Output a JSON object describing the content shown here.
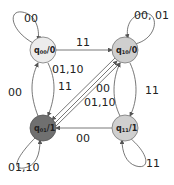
{
  "diagram": {
    "type": "state-machine",
    "states": [
      {
        "id": "q00",
        "name": "q",
        "sub": "00",
        "output": "/0",
        "fill": "#ececec",
        "cx": 43,
        "cy": 50
      },
      {
        "id": "q10",
        "name": "q",
        "sub": "10",
        "output": "/0",
        "fill": "#cfcfcf",
        "cx": 125,
        "cy": 50
      },
      {
        "id": "q01",
        "name": "q",
        "sub": "01",
        "output": "/1",
        "fill": "#707070",
        "cx": 43,
        "cy": 128
      },
      {
        "id": "q11",
        "name": "q",
        "sub": "11",
        "output": "/1",
        "fill": "#cfcfcf",
        "cx": 125,
        "cy": 128
      }
    ],
    "labels": {
      "loop_q00": "00",
      "loop_q10": "00, 01",
      "loop_q01": "01,10",
      "loop_q11": "11",
      "q00_to_q10": "11",
      "q00_to_q01": "01,10",
      "q01_to_q00": "00",
      "diag_11": "11",
      "diag_00": "00",
      "diag_0110": "01,10",
      "q10_q11": "11",
      "q11_to_q01": "00"
    }
  }
}
